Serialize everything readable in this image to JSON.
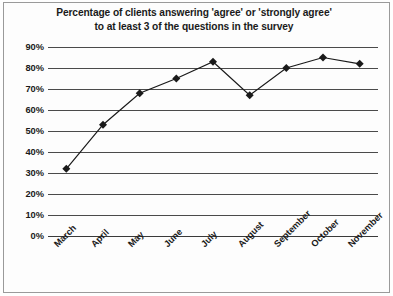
{
  "chart_data": {
    "type": "line",
    "title": "Percentage of clients answering 'agree' or 'strongly agree' to at least 3 of the questions in the survey",
    "title_lines": [
      "Percentage of clients answering 'agree' or 'strongly agree'",
      "to at least 3 of the questions in the survey"
    ],
    "categories": [
      "March",
      "April",
      "May",
      "June",
      "July",
      "August",
      "September",
      "October",
      "November"
    ],
    "values": [
      32,
      53,
      68,
      75,
      83,
      67,
      80,
      85,
      82
    ],
    "xlabel": "",
    "ylabel": "",
    "ylim": [
      0,
      90
    ],
    "ytick_values": [
      0,
      10,
      20,
      30,
      40,
      50,
      60,
      70,
      80,
      90
    ],
    "ytick_labels": [
      "0%",
      "10%",
      "20%",
      "30%",
      "40%",
      "50%",
      "60%",
      "70%",
      "80%",
      "90%"
    ],
    "grid": true,
    "legend": "none",
    "marker": "diamond",
    "series_color": "#1a1a1a",
    "grid_color": "#4a4a4a",
    "background_color": "#fdfdfd",
    "border_color": "#9a9a9a"
  }
}
